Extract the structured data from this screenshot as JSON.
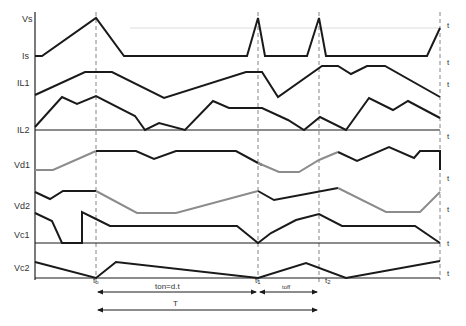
{
  "diagram": {
    "type": "timing-waveforms",
    "colors": {
      "trace": "#1a1a1a",
      "trace_grey": "#8c8c8c",
      "dashed": "#777777",
      "axis": "#222222",
      "grid": "#dddddd"
    },
    "signal_labels": [
      {
        "id": "vs",
        "text": "Vs",
        "x": 22,
        "y": 22
      },
      {
        "id": "is",
        "text": "Is",
        "x": 22,
        "y": 59
      },
      {
        "id": "il1",
        "text": "IL1",
        "x": 17,
        "y": 86
      },
      {
        "id": "il2",
        "text": "IL2",
        "x": 17,
        "y": 133
      },
      {
        "id": "vd1",
        "text": "Vd1",
        "x": 14,
        "y": 168
      },
      {
        "id": "vd2",
        "text": "Vd2",
        "x": 14,
        "y": 209
      },
      {
        "id": "vc1",
        "text": "Vc1",
        "x": 14,
        "y": 238
      },
      {
        "id": "vc2",
        "text": "Vc2",
        "x": 14,
        "y": 271
      }
    ],
    "t_axis_labels": [
      {
        "text": "t",
        "x": 447,
        "y": 28
      },
      {
        "text": "t",
        "x": 447,
        "y": 65
      },
      {
        "text": "t",
        "x": 447,
        "y": 87
      },
      {
        "text": "t",
        "x": 447,
        "y": 139
      },
      {
        "text": "t",
        "x": 447,
        "y": 181
      },
      {
        "text": "t",
        "x": 447,
        "y": 212
      },
      {
        "text": "t",
        "x": 447,
        "y": 246
      },
      {
        "text": "t",
        "x": 447,
        "y": 276
      }
    ],
    "time_markers": [
      {
        "id": "t0",
        "base": "t",
        "sub": "o",
        "x": 96
      },
      {
        "id": "t1",
        "base": "t",
        "sub": "1",
        "x": 258
      },
      {
        "id": "t2",
        "base": "t",
        "sub": "2",
        "x": 319
      },
      {
        "id": "tend",
        "base": "",
        "sub": "",
        "x": 440
      }
    ],
    "annotations": {
      "ton": "ton=d.t",
      "toff": "toff",
      "period": "T"
    },
    "traces": [
      {
        "id": "vs-is",
        "color": "trace",
        "points": "35,56 42,56 96,18 124,56 247,56 258,18 265,56 307,56 319,18 326,56 427,56 440,28"
      },
      {
        "id": "il1",
        "color": "trace",
        "points": "35,95 85,72 112,72 164,98 246,72 262,72 278,97 322,66 338,66 351,74 367,66 385,66 440,97"
      },
      {
        "id": "il2",
        "color": "trace",
        "points": "35,127 62,97 77,104 96,96 135,116 145,130 159,123 185,130 213,101 229,108 262,108 262,108 288,120 304,130 320,117 346,130 369,98 393,110 408,101 440,118"
      },
      {
        "id": "il2-base",
        "color": "trace",
        "points": "35,130 440,130"
      },
      {
        "id": "vd1-grey-a",
        "color": "trace_grey",
        "points": "35,170 53,170 96,151"
      },
      {
        "id": "vd1-black-a",
        "color": "trace",
        "points": "96,151 136,151 154,159 176,151 236,151 258,163"
      },
      {
        "id": "vd1-black-b",
        "color": "trace",
        "points": "258,163 262,165"
      },
      {
        "id": "vd1-grey-b",
        "color": "trace_grey",
        "points": "258,163 279,172 299,172 319,160 338,152"
      },
      {
        "id": "vd1-black-c",
        "color": "trace",
        "points": "338,152 357,161 389,147 414,158 420,151 440,151 440,170"
      },
      {
        "id": "vd2-black-a",
        "color": "trace",
        "points": "35,192 50,199 63,191 96,191"
      },
      {
        "id": "vd2-grey-a",
        "color": "trace_grey",
        "points": "96,191 137,213 176,213 258,191"
      },
      {
        "id": "vd2-black-b",
        "color": "trace",
        "points": "258,191 274,200 338,188"
      },
      {
        "id": "vd2-grey-b",
        "color": "trace_grey",
        "points": "338,188 386,212 420,212 440,192"
      },
      {
        "id": "vc1",
        "color": "trace",
        "points": "35,213 52,221 62,243 82,243 82,212 96,219 110,226 237,226 258,243 271,233 296,220 319,214 342,226 415,226 440,243"
      },
      {
        "id": "vc1-base",
        "color": "trace",
        "points": "35,243 440,243"
      },
      {
        "id": "vc2",
        "color": "trace",
        "points": "35,262 96,278 116,262 258,278 306,263 346,278 440,261"
      },
      {
        "id": "vc2-base",
        "color": "trace",
        "points": "35,278 440,278"
      }
    ],
    "grid_lines": [
      {
        "x1": 130,
        "y1": 28,
        "x2": 440,
        "y2": 28
      }
    ]
  }
}
